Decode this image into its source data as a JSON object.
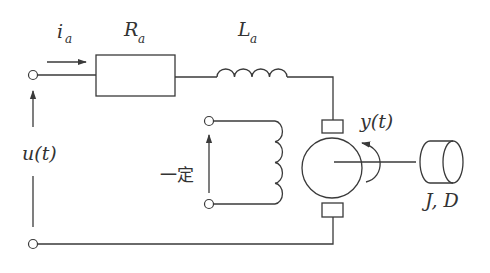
{
  "diagram": {
    "type": "circuit",
    "labels": {
      "current_main": "i",
      "current_sub": "a",
      "resistor_main": "R",
      "resistor_sub": "a",
      "inductor_main": "L",
      "inductor_sub": "a",
      "input_voltage": "u(t)",
      "field_excitation": "一定",
      "output_angle": "y(t)",
      "load": "J,  D"
    },
    "components": [
      {
        "id": "input-terminal-top",
        "kind": "terminal"
      },
      {
        "id": "input-terminal-bottom",
        "kind": "terminal"
      },
      {
        "id": "armature-resistor",
        "kind": "resistor",
        "label": "R_a"
      },
      {
        "id": "armature-inductor",
        "kind": "inductor",
        "label": "L_a"
      },
      {
        "id": "field-coil",
        "kind": "inductor",
        "label": "一定"
      },
      {
        "id": "dc-motor",
        "kind": "motor"
      },
      {
        "id": "inertial-load",
        "kind": "load",
        "label": "J, D"
      }
    ],
    "colors": {
      "line": "#3a3a3a",
      "text": "#333333",
      "background": "#ffffff"
    }
  }
}
